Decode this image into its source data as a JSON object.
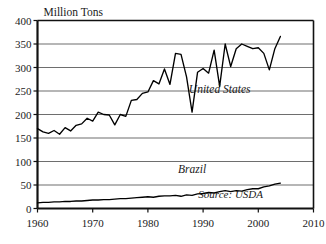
{
  "chart_data": {
    "type": "line",
    "title": "Million Tons",
    "xlabel": "",
    "ylabel": "Million Tons",
    "xlim": [
      1960,
      2010
    ],
    "ylim": [
      0,
      400
    ],
    "yticks": [
      0,
      50,
      100,
      150,
      200,
      250,
      300,
      350,
      400
    ],
    "xticks": [
      1960,
      1970,
      1980,
      1990,
      2000,
      2010
    ],
    "grid": true,
    "legend_position": "inline-annotation",
    "annotations": [
      {
        "text": "United States",
        "x": 1993,
        "y": 245
      },
      {
        "text": "Brazil",
        "x": 1988,
        "y": 75
      },
      {
        "text": "Source: USDA",
        "x": 1995,
        "y": 22
      }
    ],
    "series": [
      {
        "name": "United States",
        "color": "#000000",
        "x": [
          1960,
          1961,
          1962,
          1963,
          1964,
          1965,
          1966,
          1967,
          1968,
          1969,
          1970,
          1971,
          1972,
          1973,
          1974,
          1975,
          1976,
          1977,
          1978,
          1979,
          1980,
          1981,
          1982,
          1983,
          1984,
          1985,
          1986,
          1987,
          1988,
          1989,
          1990,
          1991,
          1992,
          1993,
          1994,
          1995,
          1996,
          1997,
          1998,
          1999,
          2000,
          2001,
          2002,
          2003,
          2004
        ],
        "values": [
          170,
          163,
          160,
          166,
          158,
          172,
          165,
          177,
          180,
          192,
          186,
          205,
          200,
          199,
          178,
          200,
          196,
          230,
          232,
          245,
          248,
          272,
          265,
          297,
          264,
          330,
          328,
          280,
          205,
          290,
          298,
          288,
          337,
          260,
          350,
          302,
          340,
          350,
          345,
          340,
          342,
          330,
          295,
          340,
          366
        ]
      },
      {
        "name": "Brazil",
        "color": "#000000",
        "x": [
          1960,
          1961,
          1962,
          1963,
          1964,
          1965,
          1966,
          1967,
          1968,
          1969,
          1970,
          1971,
          1972,
          1973,
          1974,
          1975,
          1976,
          1977,
          1978,
          1979,
          1980,
          1981,
          1982,
          1983,
          1984,
          1985,
          1986,
          1987,
          1988,
          1989,
          1990,
          1991,
          1992,
          1993,
          1994,
          1995,
          1996,
          1997,
          1998,
          1999,
          2000,
          2001,
          2002,
          2003,
          2004
        ],
        "values": [
          12,
          13,
          13,
          14,
          14,
          15,
          15,
          16,
          16,
          17,
          18,
          18,
          19,
          19,
          20,
          21,
          21,
          22,
          23,
          24,
          25,
          24,
          26,
          27,
          27,
          28,
          26,
          29,
          28,
          31,
          32,
          34,
          33,
          36,
          38,
          36,
          38,
          37,
          40,
          42,
          42,
          46,
          48,
          52,
          54
        ]
      }
    ]
  }
}
